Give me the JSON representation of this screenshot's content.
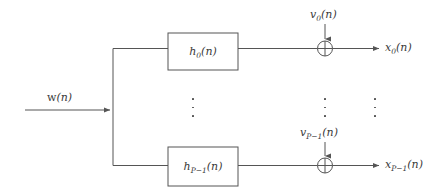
{
  "diagram": {
    "background_color": "#ffffff",
    "line_color": "#555555",
    "text_color": "#3a3a3a",
    "input": {
      "label_base": "w",
      "label_sub": "",
      "label_arg": "(n)",
      "label_full": "w(n)"
    },
    "blocks": [
      {
        "name": "filter-block-0",
        "label_base": "h",
        "label_sub": "0",
        "label_arg": "(n)",
        "label_full": "h0(n)"
      },
      {
        "name": "filter-block-p-minus-1",
        "label_base": "h",
        "label_sub": "P−1",
        "label_arg": "(n)",
        "label_full": "hP−1(n)"
      }
    ],
    "noise_inputs": [
      {
        "name": "noise-0",
        "label_base": "v",
        "label_sub": "0",
        "label_arg": "(n)",
        "label_full": "v0(n)"
      },
      {
        "name": "noise-p-minus-1",
        "label_base": "v",
        "label_sub": "P−1",
        "label_arg": "(n)",
        "label_full": "vP−1(n)"
      }
    ],
    "outputs": [
      {
        "name": "output-0",
        "label_base": "x",
        "label_sub": "0",
        "label_arg": "(n)",
        "label_full": "x0(n)"
      },
      {
        "name": "output-p-minus-1",
        "label_base": "x",
        "label_sub": "P−1",
        "label_arg": "(n)",
        "label_full": "xP−1(n)"
      }
    ],
    "adders": [
      {
        "name": "summing-junction-0",
        "symbol": "⊕"
      },
      {
        "name": "summing-junction-p-minus-1",
        "symbol": "⊕"
      }
    ],
    "ellipses": [
      {
        "name": "ellipsis-blocks",
        "symbol": "⋮"
      },
      {
        "name": "ellipsis-noise",
        "symbol": "⋮"
      },
      {
        "name": "ellipsis-outputs",
        "symbol": "⋮"
      }
    ]
  }
}
